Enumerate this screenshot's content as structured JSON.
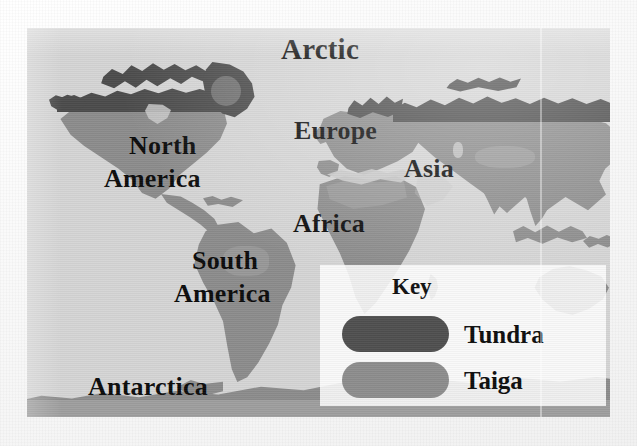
{
  "page": {
    "kind": "world-biome-map-slide",
    "canvas": {
      "width": 637,
      "height": 446
    },
    "background_color": "#fdfdfd"
  },
  "map": {
    "frame": {
      "x": 27,
      "y": 28,
      "width": 583,
      "height": 389
    },
    "colors": {
      "ocean": "#d5d5d5",
      "land": "#8c8c8c",
      "tundra": "#4b4b4b",
      "ice_sheet": "#c9c9c9",
      "inland_highlight": "#c4c4c4"
    },
    "labels": [
      {
        "name": "arctic",
        "text": "Arctic",
        "x": 281,
        "y": 35,
        "font_size": 29
      },
      {
        "name": "north",
        "text": "North",
        "x": 129,
        "y": 133,
        "font_size": 26
      },
      {
        "name": "north-america",
        "text": "America",
        "x": 104,
        "y": 166,
        "font_size": 26
      },
      {
        "name": "europe",
        "text": "Europe",
        "x": 294,
        "y": 118,
        "font_size": 26
      },
      {
        "name": "asia",
        "text": "Asia",
        "x": 404,
        "y": 156,
        "font_size": 26
      },
      {
        "name": "africa",
        "text": "Africa",
        "x": 293,
        "y": 211,
        "font_size": 26
      },
      {
        "name": "south",
        "text": "South",
        "x": 192,
        "y": 248,
        "font_size": 26
      },
      {
        "name": "south-america",
        "text": "America",
        "x": 174,
        "y": 281,
        "font_size": 26
      },
      {
        "name": "antarctica",
        "text": "Antarctica",
        "x": 88,
        "y": 374,
        "font_size": 26
      }
    ]
  },
  "legend": {
    "title": "Key",
    "items": [
      {
        "name": "tundra",
        "label": "Tundra",
        "color": "#4f4f4f"
      },
      {
        "name": "taiga",
        "label": "Taiga",
        "color": "#8d8d8d"
      }
    ]
  }
}
